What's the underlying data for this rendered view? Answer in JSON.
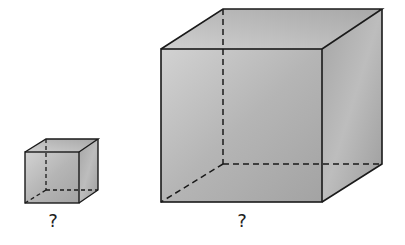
{
  "diagram": {
    "type": "cube-comparison",
    "cubes": [
      {
        "id": "small",
        "label": "?"
      },
      {
        "id": "large",
        "label": "?"
      }
    ],
    "colors": {
      "face_light": "#c9c9c9",
      "face_dark": "#9a9a9a",
      "edge": "#1a1a1a",
      "background": "#ffffff"
    }
  }
}
